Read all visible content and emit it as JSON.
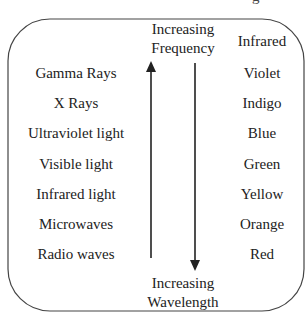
{
  "clipped_text": "g",
  "header": {
    "frequency_label_line1": "Increasing",
    "frequency_label_line2": "Frequency",
    "right_column_top": "Infrared"
  },
  "footer": {
    "wavelength_label_line1": "Increasing",
    "wavelength_label_line2": "Wavelength"
  },
  "spectrum": {
    "left_items": [
      "Gamma Rays",
      "X Rays",
      "Ultraviolet light",
      "Visible light",
      "Infrared light",
      "Microwaves",
      "Radio waves"
    ],
    "right_items": [
      "Violet",
      "Indigo",
      "Blue",
      "Green",
      "Yellow",
      "Orange",
      "Red"
    ]
  },
  "arrows": [
    {
      "name": "frequency-arrow",
      "direction": "up"
    },
    {
      "name": "wavelength-arrow",
      "direction": "down"
    }
  ],
  "colors": {
    "line": "#333333",
    "text": "#222222",
    "background": "#ffffff"
  }
}
